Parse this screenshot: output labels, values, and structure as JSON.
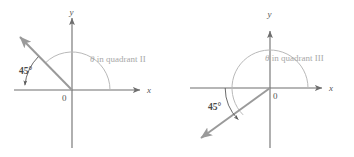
{
  "figure": {
    "colors": {
      "axis": "#6e6e6e",
      "ray": "#9a9a9a",
      "theta_arc": "#b9b9b9",
      "reference_arc": "#5a5a5a",
      "label": "#555555",
      "quadrant_label": "#a8a8a8",
      "background": "#ffffff"
    },
    "panels": [
      {
        "id": "quadrant-II",
        "caption": "θ in quadrant II",
        "theta_symbol": "θ",
        "caption_rest": " in quadrant II",
        "reference_angle_label": "45°",
        "reference_angle_value": 45,
        "theta_value": 135,
        "quadrant": "II",
        "origin_label": "0",
        "x_axis_label": "x",
        "y_axis_label": "y",
        "ray_direction": "up-left",
        "terminal_ray_angle_deg": 135
      },
      {
        "id": "quadrant-III",
        "caption": "θ in quadrant III",
        "theta_symbol": "θ",
        "caption_rest": " in quadrant III",
        "reference_angle_label": "45°",
        "reference_angle_value": 45,
        "theta_value": 225,
        "quadrant": "III",
        "origin_label": "0",
        "x_axis_label": "x",
        "y_axis_label": "y",
        "ray_direction": "down-left",
        "terminal_ray_angle_deg": 225
      }
    ]
  }
}
